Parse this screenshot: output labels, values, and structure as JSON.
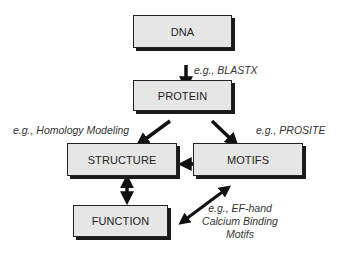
{
  "diagram": {
    "nodes": {
      "dna": "DNA",
      "protein": "PROTEIN",
      "structure": "STRUCTURE",
      "motifs": "MOTIFS",
      "function": "FUNCTION"
    },
    "edge_labels": {
      "dna_to_protein": "e.g., BLASTX",
      "protein_to_structure": "e.g., Homology Modeling",
      "protein_to_motifs": "e.g., PROSITE",
      "motifs_function_line1": "e.g., EF-hand",
      "motifs_function_line2": "Calcium Binding",
      "motifs_function_line3": "Motifs"
    },
    "colors": {
      "box_fill": "#e6e6e6",
      "box_border": "#222222",
      "arrow": "#111111"
    }
  }
}
